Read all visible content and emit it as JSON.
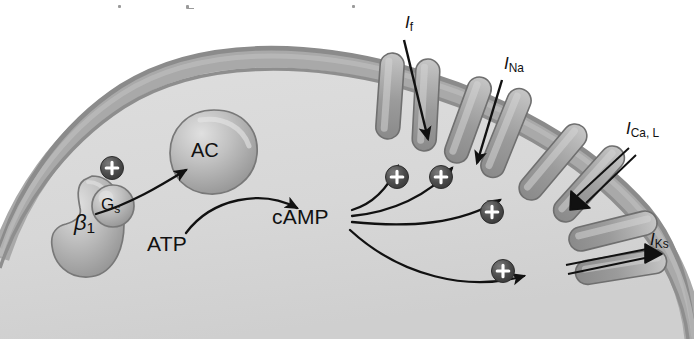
{
  "figure": {
    "kind": "cell-signaling-diagram",
    "background_color": "#ffffff"
  },
  "palette": {
    "membrane_outer_line": "#8d8d8d",
    "membrane_band": "#a9a9a9",
    "membrane_inner_line": "#8a8a8a",
    "cytosol": "#d8d8d8",
    "extracellular": "#ffffff",
    "channel_fill": "#9d9d9d",
    "channel_highlight": "#c9c9c9",
    "channel_edge": "#6f6f6f",
    "blob_fill": "#b8b8b8",
    "blob_highlight": "#dcdcdc",
    "blob_edge": "#767676",
    "plus_fill": "#4a4a4a",
    "plus_glyph": "#ffffff",
    "arrow_stroke": "#111111",
    "text": "#111111"
  },
  "membrane": {
    "description": "curved cell membrane arc running from lower-left up across the top and down the right side"
  },
  "proteins": [
    {
      "id": "beta1-receptor",
      "label": "β",
      "subscript": "1",
      "shape": "kidney",
      "x": 60,
      "y": 228
    },
    {
      "id": "g-protein",
      "label": "G",
      "subscript": "s",
      "shape": "circle",
      "x": 113,
      "y": 206
    },
    {
      "id": "adenylyl-cyclase",
      "label": "AC",
      "subscript": "",
      "shape": "teardrop",
      "x": 212,
      "y": 152
    }
  ],
  "molecules": [
    {
      "id": "atp",
      "label": "ATP",
      "x": 181,
      "y": 247
    },
    {
      "id": "camp",
      "label": "cAMP",
      "x": 313,
      "y": 219
    }
  ],
  "currents": [
    {
      "id": "if",
      "label": "I",
      "subscript": "f",
      "x": 411,
      "y": 23,
      "name": "funny-current"
    },
    {
      "id": "ina",
      "label": "I",
      "subscript": "Na",
      "x": 510,
      "y": 64,
      "name": "sodium-current"
    },
    {
      "id": "ical",
      "label": "I",
      "subscript": "Ca, L",
      "x": 629,
      "y": 130,
      "name": "l-type-calcium-current"
    },
    {
      "id": "iks",
      "label": "I",
      "subscript": "Ks",
      "x": 654,
      "y": 240,
      "name": "slow-delayed-rectifier-potassium-current"
    }
  ],
  "plus_markers": [
    {
      "id": "plus-gs",
      "x": 112,
      "y": 168,
      "glyph": "+"
    },
    {
      "id": "plus-if",
      "x": 397,
      "y": 177,
      "glyph": "+"
    },
    {
      "id": "plus-ina",
      "x": 441,
      "y": 177,
      "glyph": "+"
    },
    {
      "id": "plus-ical",
      "x": 492,
      "y": 212,
      "glyph": "+"
    },
    {
      "id": "plus-iks",
      "x": 503,
      "y": 271,
      "glyph": "+"
    }
  ],
  "arrows": [
    {
      "id": "arrow-gs-to-ac",
      "from": "g-protein",
      "to": "adenylyl-cyclase",
      "style": "solid-curved"
    },
    {
      "id": "arrow-atp-to-camp",
      "from": "atp",
      "to": "camp",
      "style": "solid-curved"
    },
    {
      "id": "arrow-camp-to-if",
      "from": "camp",
      "to": "if",
      "style": "solid-curved"
    },
    {
      "id": "arrow-camp-to-ina",
      "from": "camp",
      "to": "ina",
      "style": "solid-curved"
    },
    {
      "id": "arrow-camp-to-ical",
      "from": "camp",
      "to": "ical",
      "style": "solid-curved"
    },
    {
      "id": "arrow-camp-to-iks",
      "from": "camp",
      "to": "iks",
      "style": "solid-curved"
    },
    {
      "id": "arrow-if-influx",
      "from": "if",
      "to": "cytosol",
      "style": "solid-straight"
    },
    {
      "id": "arrow-ina-influx",
      "from": "ina",
      "to": "cytosol",
      "style": "solid-straight"
    },
    {
      "id": "arrow-ical-influx",
      "from": "ical",
      "to": "cytosol",
      "style": "outlined-straight"
    },
    {
      "id": "arrow-iks-efflux",
      "from": "iks",
      "to": "cytosol",
      "style": "outlined-straight"
    }
  ],
  "channels": [
    {
      "id": "ch-1",
      "cx": 390,
      "cy": 96,
      "angle": 4,
      "len": 86,
      "w": 23
    },
    {
      "id": "ch-2",
      "cx": 426,
      "cy": 103,
      "angle": 3,
      "len": 92,
      "w": 23
    },
    {
      "id": "ch-3",
      "cx": 468,
      "cy": 118,
      "angle": 20,
      "len": 90,
      "w": 23
    },
    {
      "id": "ch-4",
      "cx": 505,
      "cy": 131,
      "angle": 23,
      "len": 94,
      "w": 23
    },
    {
      "id": "ch-5",
      "cx": 553,
      "cy": 160,
      "angle": 40,
      "len": 92,
      "w": 23
    },
    {
      "id": "ch-6",
      "cx": 588,
      "cy": 181,
      "angle": 42,
      "len": 94,
      "w": 23
    },
    {
      "id": "ch-7",
      "cx": 613,
      "cy": 228,
      "angle": 75,
      "len": 90,
      "w": 23
    },
    {
      "id": "ch-8",
      "cx": 622,
      "cy": 264,
      "angle": 80,
      "len": 92,
      "w": 23
    }
  ]
}
